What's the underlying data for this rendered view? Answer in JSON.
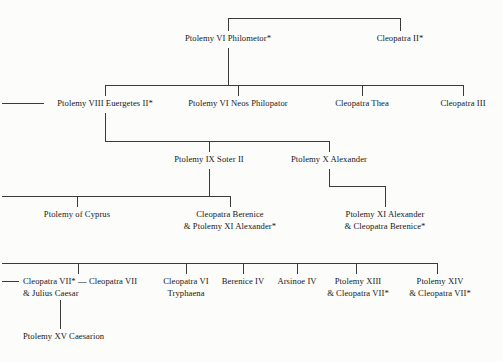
{
  "diagram": {
    "background_color": "#fcfcfa",
    "line_color": "#3a3a3c",
    "text_color": "#17171a"
  },
  "generations": [
    {
      "id": "gen1",
      "nodes": [
        {
          "id": "ptolemy-vi-philometor",
          "line1": "Ptolemy VI Philometor*",
          "line2": ""
        },
        {
          "id": "cleopatra-ii",
          "line1": "Cleopatra II*",
          "line2": ""
        }
      ]
    },
    {
      "id": "gen2",
      "nodes": [
        {
          "id": "ptolemy-viii-euergetes-ii",
          "line1": "Ptolemy VIII Euergetes II*",
          "line2": ""
        },
        {
          "id": "ptolemy-vi-neos-philopator",
          "line1": "Ptolemy VI Neos Philopator",
          "line2": ""
        },
        {
          "id": "cleopatra-thea",
          "line1": "Cleopatra Thea",
          "line2": ""
        },
        {
          "id": "cleopatra-iii",
          "line1": "Cleopatra III",
          "line2": ""
        }
      ]
    },
    {
      "id": "gen3",
      "nodes": [
        {
          "id": "ptolemy-ix-soter-ii",
          "line1": "Ptolemy IX Soter II",
          "line2": ""
        },
        {
          "id": "ptolemy-x-alexander",
          "line1": "Ptolemy X Alexander",
          "line2": ""
        }
      ]
    },
    {
      "id": "gen4",
      "nodes": [
        {
          "id": "ptolemy-of-cyprus",
          "line1": "Ptolemy of Cyprus",
          "line2": ""
        },
        {
          "id": "cleopatra-berenice",
          "line1": "Cleopatra Berenice",
          "line2": "& Ptolemy XI Alexander*"
        },
        {
          "id": "ptolemy-xi-alexander",
          "line1": "Ptolemy XI Alexander",
          "line2": "& Cleopatra Berenice*"
        }
      ]
    },
    {
      "id": "gen5",
      "nodes": [
        {
          "id": "cleopatra-vii-julius-caesar",
          "line1": "Cleopatra VII* — Cleopatra VII",
          "line2": "& Julius Caesar"
        },
        {
          "id": "cleopatra-vi-tryphaena",
          "line1": "Cleopatra VI",
          "line2": "Tryphaena"
        },
        {
          "id": "berenice-iv",
          "line1": "Berenice IV",
          "line2": ""
        },
        {
          "id": "arsinoe-iv",
          "line1": "Arsinoe IV",
          "line2": ""
        },
        {
          "id": "ptolemy-xiii",
          "line1": "Ptolemy XIII",
          "line2": "& Cleopatra VII*"
        },
        {
          "id": "ptolemy-xiv",
          "line1": "Ptolemy XIV",
          "line2": "& Cleopatra VII*"
        }
      ]
    },
    {
      "id": "gen6",
      "nodes": [
        {
          "id": "ptolemy-xv-caesarion",
          "line1": "Ptolemy XV Caesarion",
          "line2": ""
        }
      ]
    }
  ]
}
